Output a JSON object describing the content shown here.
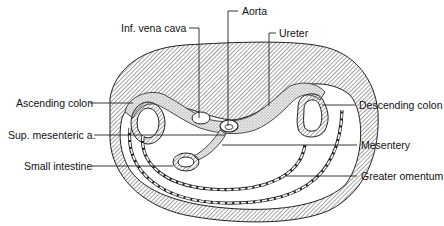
{
  "figure": {
    "type": "anatomical cross-section",
    "labels": {
      "aorta": "Aorta",
      "inf_vena_cava": "Inf. vena cava",
      "ureter": "Ureter",
      "ascending_colon": "Ascending colon",
      "descending_colon": "Descending colon",
      "sup_mesenteric_a": "Sup. mesenteric a.",
      "mesentery": "Mesentery",
      "small_intestine": "Small intestine",
      "greater_omentum": "Greater omentum"
    },
    "colors": {
      "line": "#222222",
      "hatch": "#333333",
      "stipple": "#bbbbbb",
      "background": "#ffffff"
    }
  }
}
